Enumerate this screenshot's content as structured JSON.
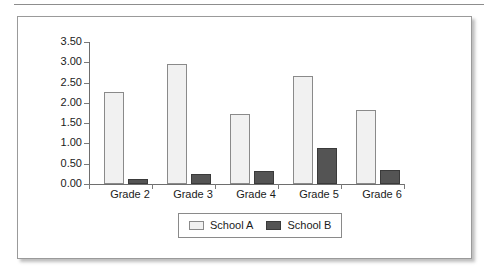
{
  "chart_data": {
    "type": "bar",
    "title": "",
    "subtitle": "",
    "xlabel": "",
    "ylabel": "",
    "categories": [
      "Grade 2",
      "Grade 3",
      "Grade 4",
      "Grade 5",
      "Grade 6"
    ],
    "series": [
      {
        "name": "School A",
        "color": "#f1f1f1",
        "values": [
          2.28,
          2.95,
          1.72,
          2.67,
          1.82
        ]
      },
      {
        "name": "School B",
        "color": "#545454",
        "values": [
          0.12,
          0.24,
          0.31,
          0.88,
          0.35
        ]
      }
    ],
    "ylim": [
      0.0,
      3.5
    ],
    "ytick_step": 0.5,
    "ytick_labels": [
      "3.50",
      "3.00",
      "2.50",
      "2.00",
      "1.50",
      "1.00",
      "0.50",
      "0.00"
    ],
    "ytick_values": [
      3.5,
      3.0,
      2.5,
      2.0,
      1.5,
      1.0,
      0.5,
      0.0
    ],
    "grid": false,
    "legend_position": "bottom",
    "legend_entries": [
      "School A",
      "School B"
    ]
  },
  "axis": {
    "y_labels": [
      "3.50",
      "3.00",
      "2.50",
      "2.00",
      "1.50",
      "1.00",
      "0.50",
      "0.00"
    ],
    "x_labels": [
      "Grade 2",
      "Grade 3",
      "Grade 4",
      "Grade 5",
      "Grade 6"
    ]
  },
  "legend": {
    "items": [
      {
        "label": "School A",
        "swatch": "light-gray-swatch"
      },
      {
        "label": "School B",
        "swatch": "dark-gray-swatch"
      }
    ]
  }
}
